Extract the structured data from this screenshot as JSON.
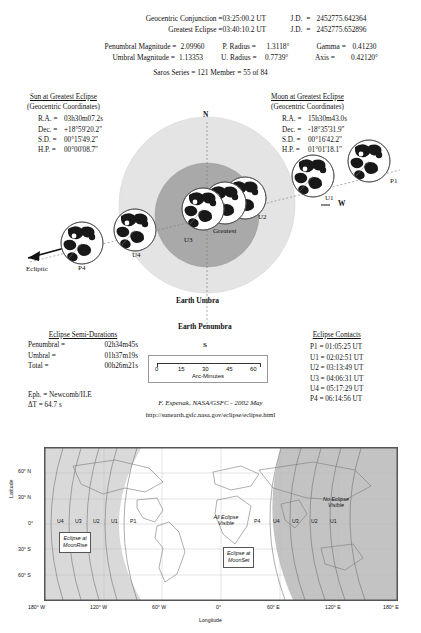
{
  "header": {
    "rows": [
      {
        "label": "Geocentric Conjunction =",
        "value": "03:25:00.2 UT",
        "jd_label": "J.D.  =",
        "jd": "2452775.642364"
      },
      {
        "label": "Greatest Eclipse =",
        "value": "03:40:10.2 UT",
        "jd_label": "J.D.  =",
        "jd": "2452775.652896"
      }
    ],
    "magnitudes": [
      {
        "label": "Penumbral Magnitude =",
        "value": "2.09960",
        "mid_label": "P. Radius =",
        "mid_value": "1.3118°",
        "right_label": "Gamma =",
        "right_value": "0.41230"
      },
      {
        "label": "Umbral Magnitude =",
        "value": "1.13353",
        "mid_label": "U. Radius =",
        "mid_value": "0.7739°",
        "right_label": "Axis =",
        "right_value": "0.42120°"
      }
    ],
    "saros": "Saros Series = 121        Member = 55 of 84"
  },
  "sun": {
    "title": "Sun at Greatest Eclipse",
    "subtitle": "(Geocentric Coordinates)",
    "rows": [
      {
        "key": "R.A.  =",
        "value": "03h30m07.2s"
      },
      {
        "key": "Dec.  =",
        "value": "+18°59'20.2\""
      },
      {
        "key": "S.D.  =",
        "value": "00°15'49.2\""
      },
      {
        "key": "H.P.  =",
        "value": "00°00'08.7\""
      }
    ]
  },
  "moon": {
    "title": "Moon at Greatest Eclipse",
    "subtitle": "(Geocentric Coordinates)",
    "rows": [
      {
        "key": "R.A.  =",
        "value": "15h30m43.0s"
      },
      {
        "key": "Dec.  =",
        "value": "-18°35'31.9\""
      },
      {
        "key": "S.D.  =",
        "value": "00°16'42.2\""
      },
      {
        "key": "H.P.  =",
        "value": "01°01'18.1\""
      }
    ]
  },
  "diagram": {
    "north": "N",
    "south": "S",
    "west": "W",
    "ecliptic": "Ecliptic",
    "umbra": "Earth Umbra",
    "penumbra": "Earth Penumbra",
    "contacts": [
      "P1",
      "U1",
      "U2",
      "Greatest",
      "U3",
      "U4",
      "P4"
    ],
    "colors": {
      "penumbra": "#e2e2e2",
      "umbra": "#a9a9a9",
      "moon_dark": "#1a1a1a"
    }
  },
  "semi_durations": {
    "title": "Eclipse Semi-Durations",
    "rows": [
      {
        "key": "Penumbral =",
        "value": "02h34m45s"
      },
      {
        "key": "Umbral =",
        "value": "01h37m19s"
      },
      {
        "key": "Total =",
        "value": "00h26m21s"
      }
    ]
  },
  "ephemeris": {
    "eph": "Eph.  = Newcomb/ILE",
    "dt": "ΔT =    64.7 s"
  },
  "contacts_panel": {
    "title": "Eclipse Contacts",
    "rows": [
      {
        "key": "P1 =",
        "value": "01:05:25 UT"
      },
      {
        "key": "U1 =",
        "value": "02:02:51 UT"
      },
      {
        "key": "U2 =",
        "value": "03:13:49 UT"
      },
      {
        "key": "U3 =",
        "value": "04:06:31 UT"
      },
      {
        "key": "U4 =",
        "value": "05:17:29 UT"
      },
      {
        "key": "P4 =",
        "value": "06:14:56 UT"
      }
    ]
  },
  "scale": {
    "ticks": [
      "0",
      "15",
      "30",
      "45",
      "60"
    ],
    "unit": "Arc-Minutes"
  },
  "credit": {
    "author": "F. Espenak, NASA/GSFC - 2002 May",
    "url": "http://sunearth.gsfc.nasa.gov/eclipse/eclipse.html"
  },
  "map": {
    "lat_label": "Latitude",
    "lon_label": "Longitude",
    "lat_ticks": [
      "60° N",
      "30° N",
      "0°",
      "30° S",
      "60° S"
    ],
    "lon_ticks": [
      "180° W",
      "120° W",
      "60° W",
      "0°",
      "60° E",
      "120° E",
      "180° E"
    ],
    "regions": [
      {
        "name": "all-visible",
        "text": "All Eclipse\nVisible"
      },
      {
        "name": "no-visible",
        "text": "No Eclipse\nVisible"
      }
    ],
    "boxes": [
      {
        "name": "moonrise",
        "line1": "Eclipse at",
        "line2": "MoonRise"
      },
      {
        "name": "moonset",
        "line1": "Eclipse at",
        "line2": "MoonSet"
      }
    ],
    "contour_labels_left": [
      "U4",
      "U3",
      "U2",
      "U1",
      "P1"
    ],
    "contour_labels_right": [
      "P4",
      "U4",
      "U3",
      "U2",
      "U1"
    ]
  }
}
